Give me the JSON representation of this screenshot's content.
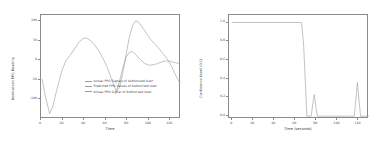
{
  "figure": {
    "background": "#ffffff",
    "line_color": "#9b9b9b",
    "axis_color": "#8a8a8a",
    "text_color": "#3c3c3c"
  },
  "chart_data": [
    {
      "type": "line",
      "title": "",
      "xlabel": "Time",
      "ylabel": "Normalised PPG Reading",
      "xlim": [
        0,
        130
      ],
      "ylim": [
        -150,
        115
      ],
      "xticks": [
        0,
        20,
        40,
        60,
        80,
        100,
        120
      ],
      "yticks": [
        -100,
        -50,
        0,
        50,
        100
      ],
      "xticklabels": [
        "0",
        "20",
        "40",
        "60",
        "80",
        "100",
        "120"
      ],
      "yticklabels": [
        "-100",
        "-50",
        "0",
        "50",
        "100"
      ],
      "grid": false,
      "legend_position": "lower right",
      "legend": [
        "Actual PPG Signals of Authorised User",
        "Predicted PPG Values of Authorised User",
        "Actual PPG Signal of Authorised User"
      ],
      "series": [
        {
          "name": "Actual PPG Signals of Authorised User",
          "x": [
            1,
            4,
            8,
            11,
            15,
            19,
            23,
            27,
            31,
            35,
            39,
            42,
            46,
            50,
            54,
            58,
            62,
            66,
            70,
            73,
            76,
            79,
            82,
            85,
            88,
            91,
            94,
            98,
            102,
            106,
            110,
            114,
            118,
            122,
            126,
            129
          ],
          "y": [
            -48,
            -92,
            -136,
            -118,
            -72,
            -30,
            -2,
            12,
            28,
            45,
            55,
            57,
            50,
            38,
            22,
            2,
            -22,
            -52,
            -80,
            -68,
            -32,
            14,
            58,
            88,
            100,
            96,
            84,
            68,
            52,
            40,
            28,
            14,
            0,
            -20,
            -44,
            -58
          ]
        },
        {
          "name": "Predicted PPG Values of Authorised User",
          "x": [
            70,
            73,
            76,
            79,
            82,
            85,
            88,
            92,
            96,
            100,
            104,
            108,
            112,
            116,
            120,
            124,
            127,
            129
          ],
          "y": [
            -80,
            -52,
            -20,
            8,
            20,
            22,
            14,
            2,
            -8,
            -13,
            -12,
            -9,
            -5,
            -2,
            -3,
            -6,
            -8,
            -9
          ]
        }
      ]
    },
    {
      "type": "line",
      "title": "",
      "xlabel": "Time (seconds)",
      "ylabel": "Confidence Level (0-1)",
      "xlim": [
        -3,
        130
      ],
      "ylim": [
        -0.03,
        1.08
      ],
      "xticks": [
        0,
        20,
        40,
        60,
        80,
        100,
        120
      ],
      "yticks": [
        0.0,
        0.2,
        0.4,
        0.6,
        0.8,
        1.0
      ],
      "xticklabels": [
        "0",
        "20",
        "40",
        "60",
        "80",
        "100",
        "120"
      ],
      "yticklabels": [
        "0.0",
        "0.2",
        "0.4",
        "0.6",
        "0.8",
        "1.0"
      ],
      "grid": false,
      "legend_position": "none",
      "legend": [],
      "series": [
        {
          "name": "Confidence Level",
          "x": [
            0,
            66,
            68,
            71,
            75,
            76.5,
            78,
            79.5,
            81,
            116,
            117.5,
            119,
            120.5,
            122,
            130
          ],
          "y": [
            1.0,
            1.0,
            0.74,
            0.0,
            0.0,
            0.12,
            0.23,
            0.1,
            0.0,
            0.0,
            0.18,
            0.36,
            0.17,
            0.0,
            0.0
          ]
        }
      ]
    }
  ]
}
